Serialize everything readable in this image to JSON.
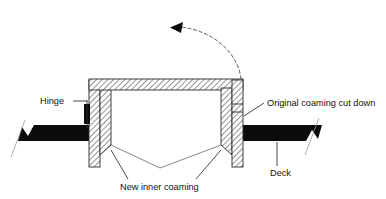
{
  "figure": {
    "kind": "technical-cross-section-diagram",
    "background_color": "#ffffff",
    "line_color": "#2a2a2a",
    "hatch_color": "#7d7d7d",
    "deck_color": "#0b0b0b",
    "text_color": "#111111"
  },
  "labels": {
    "hinge": "Hinge",
    "original_coaming": "Original coaming cut down",
    "new_inner_coaming": "New inner coaming",
    "deck": "Deck"
  },
  "annotations": {
    "motion_arrow": "swing-open-direction-arc",
    "motion_arrow_description": "dashed arc with left-pointing arrowhead showing lid opening rotation"
  },
  "parts": [
    {
      "name": "hatch-lid",
      "fill": "cross-hatched"
    },
    {
      "name": "left-outer-post",
      "fill": "cross-hatched"
    },
    {
      "name": "left-inner-coaming",
      "fill": "cross-hatched"
    },
    {
      "name": "right-outer-post",
      "fill": "cross-hatched"
    },
    {
      "name": "right-inner-coaming",
      "fill": "cross-hatched"
    },
    {
      "name": "left-deck",
      "fill": "solid-black"
    },
    {
      "name": "right-deck",
      "fill": "solid-black"
    },
    {
      "name": "hinge-block",
      "fill": "solid-black"
    }
  ]
}
